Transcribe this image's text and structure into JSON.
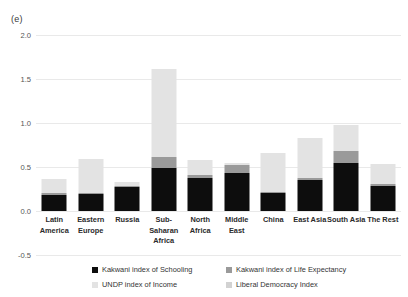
{
  "panel": {
    "label": "(e)"
  },
  "chart_data": {
    "type": "bar",
    "stacked": true,
    "title": "",
    "xlabel": "",
    "ylabel": "",
    "ylim": [
      -0.5,
      2.0
    ],
    "yticks": [
      "2.0",
      "1.5",
      "1.0",
      "0.5",
      "0.0",
      "-0.5"
    ],
    "ytick_values": [
      2.0,
      1.5,
      1.0,
      0.5,
      0.0,
      -0.5
    ],
    "grid": true,
    "legend_position": "bottom",
    "categories": [
      "Latin\nAmerica",
      "Eastern\nEurope",
      "Russia",
      "Sub-\nSaharan\nAfrica",
      "North\nAfrica",
      "Middle\nEast",
      "China",
      "East Asia",
      "South Asia",
      "The Rest"
    ],
    "series": [
      {
        "name": "Kakwani index of Schooling",
        "color": "#0d0d0d",
        "values": [
          0.18,
          0.19,
          0.27,
          0.49,
          0.38,
          0.43,
          0.2,
          0.35,
          0.55,
          0.28
        ]
      },
      {
        "name": "Kakwani index of Life Expectancy",
        "color": "#9a9a9a",
        "values": [
          0.02,
          0.02,
          0.01,
          0.12,
          0.03,
          0.09,
          0.02,
          0.03,
          0.13,
          0.03
        ]
      },
      {
        "name": "UNDP index of Income",
        "color": "#e3e3e3",
        "values": [
          0.16,
          0.38,
          0.05,
          1.0,
          0.17,
          0.02,
          0.44,
          0.45,
          0.3,
          0.22
        ]
      },
      {
        "name": "Liberal Democracy Index",
        "color": "#d2d2d2",
        "values": [
          0.0,
          0.0,
          0.0,
          0.0,
          0.0,
          0.0,
          0.0,
          0.0,
          0.0,
          0.0
        ]
      }
    ],
    "totals": [
      0.36,
      0.59,
      0.33,
      1.61,
      0.58,
      0.54,
      0.66,
      0.83,
      0.98,
      0.53
    ]
  },
  "legend": {
    "entries": [
      {
        "label": "Kakwani index of Schooling",
        "swatch": "schooling"
      },
      {
        "label": "Kakwani index of Life Expectancy",
        "swatch": "life"
      },
      {
        "label": "UNDP index of Income",
        "swatch": "income"
      },
      {
        "label": "Liberal Democracy Index",
        "swatch": "demo"
      }
    ]
  }
}
